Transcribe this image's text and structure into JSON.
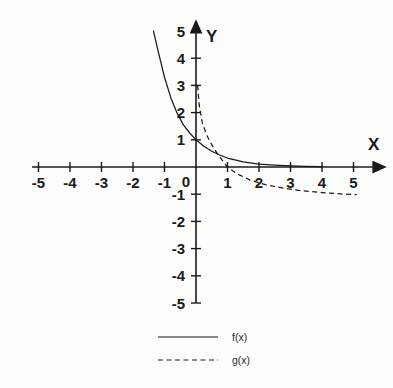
{
  "figure": {
    "background_color": "#fdfdfc",
    "ink_color": "#1a1a1a",
    "axis_x_label": "X",
    "axis_y_label": "Y",
    "x_tick_labels": [
      "-5",
      "-4",
      "-3",
      "-2",
      "-1",
      "0",
      "1",
      "2",
      "3",
      "4",
      "5"
    ],
    "y_tick_labels_positive": [
      "1",
      "2",
      "3",
      "4",
      "5"
    ],
    "y_tick_labels_negative": [
      "-1",
      "-2",
      "-3",
      "-4",
      "-5"
    ],
    "origin_label": "0"
  },
  "legend": {
    "position": "bottom-center",
    "entries": [
      {
        "label": "f(x)",
        "style": "solid",
        "color": "#1a1a1a"
      },
      {
        "label": "g(x)",
        "style": "dashed",
        "color": "#1a1a1a"
      }
    ]
  },
  "chart_data": {
    "type": "line",
    "title": "",
    "xlabel": "X",
    "ylabel": "Y",
    "xlim": [
      -5.4,
      5.4
    ],
    "ylim": [
      -5.4,
      5.4
    ],
    "grid": false,
    "xticks": [
      -5,
      -4,
      -3,
      -2,
      -1,
      0,
      1,
      2,
      3,
      4,
      5
    ],
    "yticks": [
      -5,
      -4,
      -3,
      -2,
      -1,
      1,
      2,
      3,
      4,
      5
    ],
    "legend_position": "bottom-center",
    "series": [
      {
        "name": "f(x)",
        "style": "solid",
        "color": "#1a1a1a",
        "description": "decaying exponential through (0,1), asymptotic to y=0 for large x",
        "x": [
          -1.35,
          -1.2,
          -1.0,
          -0.8,
          -0.6,
          -0.4,
          -0.2,
          0.0,
          0.25,
          0.5,
          0.75,
          1.0,
          1.5,
          2.0,
          2.5,
          3.0,
          3.5,
          4.0
        ],
        "y": [
          5.0,
          4.25,
          3.3,
          2.55,
          1.98,
          1.55,
          1.25,
          1.0,
          0.76,
          0.58,
          0.44,
          0.33,
          0.19,
          0.11,
          0.07,
          0.04,
          0.02,
          0.01
        ]
      },
      {
        "name": "g(x)",
        "style": "dashed",
        "color": "#1a1a1a",
        "description": "steep descending curve from near y=3 at x~0.05, crossing the x-axis at x=1, flattening toward y=-1 near x=5",
        "x": [
          0.05,
          0.1,
          0.2,
          0.35,
          0.5,
          0.7,
          1.0,
          1.3,
          1.7,
          2.2,
          2.8,
          3.4,
          4.0,
          4.6,
          5.1
        ],
        "y": [
          3.0,
          2.3,
          1.62,
          1.15,
          0.82,
          0.45,
          0.0,
          -0.25,
          -0.47,
          -0.65,
          -0.78,
          -0.88,
          -0.94,
          -0.99,
          -1.02
        ]
      }
    ]
  }
}
